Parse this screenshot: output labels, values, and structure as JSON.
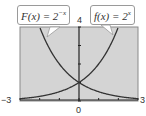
{
  "chart_data": {
    "type": "line",
    "title": "",
    "xlabel": "",
    "ylabel": "",
    "xlim": [
      -3,
      3
    ],
    "ylim": [
      0,
      4
    ],
    "grid": false,
    "x_tick_labels": {
      "left": "−3",
      "center": "0",
      "right": "3"
    },
    "y_tick_labels": {
      "top": "4"
    },
    "x_ticks": [
      -3,
      -2,
      -1,
      0,
      1,
      2,
      3
    ],
    "y_ticks": [
      0,
      1,
      2,
      3,
      4
    ],
    "series": [
      {
        "name": "F(x) = 2^-x",
        "label_main": "F(x) = 2",
        "label_exp": "−x",
        "function": "2^(-x)",
        "x": [
          -3,
          -2.5,
          -2,
          -1.5,
          -1,
          -0.5,
          0,
          0.5,
          1,
          1.5,
          2,
          2.5,
          3
        ],
        "values": [
          8,
          5.66,
          4,
          2.83,
          2,
          1.41,
          1,
          0.71,
          0.5,
          0.35,
          0.25,
          0.18,
          0.125
        ]
      },
      {
        "name": "f(x) = 2^x",
        "label_main": "f(x) = 2",
        "label_exp": "x",
        "function": "2^x",
        "x": [
          -3,
          -2.5,
          -2,
          -1.5,
          -1,
          -0.5,
          0,
          0.5,
          1,
          1.5,
          2,
          2.5,
          3
        ],
        "values": [
          0.125,
          0.18,
          0.25,
          0.35,
          0.5,
          0.71,
          1,
          1.41,
          2,
          2.83,
          4,
          5.66,
          8
        ]
      }
    ],
    "intersection": {
      "x": 0,
      "y": 1
    },
    "colors": {
      "background": "#d4d4d4",
      "curve": "#333333",
      "frame": "#8a8a8a"
    }
  }
}
